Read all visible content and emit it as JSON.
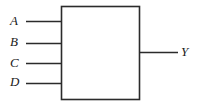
{
  "diagram": {
    "type": "black-box-logic-diagram",
    "colors": {
      "background": "#ffffff",
      "stroke": "#2b2b2b",
      "label": "#1a1a1a"
    },
    "block": {
      "name": "logic-block",
      "fill": "#ffffff",
      "x": 61,
      "y": 6,
      "width": 79,
      "height": 94,
      "label": ""
    },
    "inputs": [
      {
        "label": "A",
        "y": 21,
        "line_start_x": 26,
        "line_end_x": 61
      },
      {
        "label": "B",
        "y": 43,
        "line_start_x": 26,
        "line_end_x": 61
      },
      {
        "label": "C",
        "y": 63,
        "line_start_x": 26,
        "line_end_x": 61
      },
      {
        "label": "D",
        "y": 83,
        "line_start_x": 26,
        "line_end_x": 61
      }
    ],
    "outputs": [
      {
        "label": "Y",
        "y": 52,
        "line_start_x": 140,
        "line_end_x": 178
      }
    ]
  }
}
